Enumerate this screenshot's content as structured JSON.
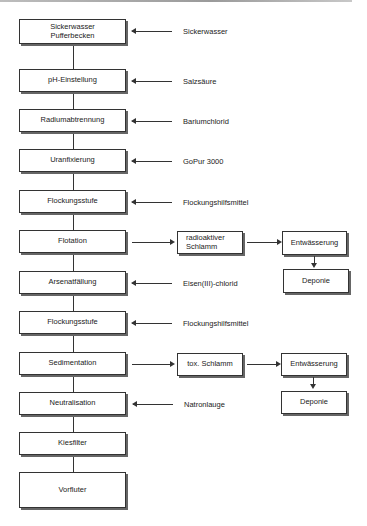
{
  "diagram": {
    "process_steps": [
      {
        "id": "sickerwasser-pufferbecken",
        "label": "Sickerwasser\nPufferbecken",
        "input": "Sickerwasser"
      },
      {
        "id": "ph-einstellung",
        "label": "pH-Einstellung",
        "input": "Salzsäure"
      },
      {
        "id": "radiumabtrennung",
        "label": "Radiumabtrennung",
        "input": "Bariumchlorid"
      },
      {
        "id": "uranfixierung",
        "label": "Uranfixierung",
        "input": "GoPur 3000"
      },
      {
        "id": "flockungsstufe-1",
        "label": "Flockungsstufe",
        "input": "Flockungshilfsmittel"
      },
      {
        "id": "flotation",
        "label": "Flotation",
        "output_chain": [
          "radioaktiver\nSchlamm",
          "Entwässerung",
          "Deponie"
        ]
      },
      {
        "id": "arsenatfaellung",
        "label": "Arsenatfällung",
        "input": "Eisen(III)-chlorid"
      },
      {
        "id": "flockungsstufe-2",
        "label": "Flockungsstufe",
        "input": "Flockungshilfsmittel"
      },
      {
        "id": "sedimentation",
        "label": "Sedimentation",
        "output_chain": [
          "tox. Schlamm",
          "Entwässerung",
          "Deponie"
        ]
      },
      {
        "id": "neutralisation",
        "label": "Neutralisation",
        "input": "Natronlauge"
      },
      {
        "id": "kiesfilter",
        "label": "Kiesfilter"
      },
      {
        "id": "vorfluter",
        "label": "Vorfluter"
      }
    ]
  }
}
